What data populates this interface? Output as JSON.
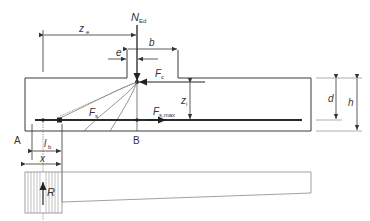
{
  "diagram": {
    "type": "strut-and-tie model of corbel / beam end with column load",
    "labels": {
      "load": "N",
      "load_sub": "Ed",
      "lever_ecc": "z",
      "lever_ecc_sub": "e",
      "eccentricity": "e",
      "column_width": "b",
      "compression_force": "F",
      "compression_sub": "c",
      "inner_lever": "z",
      "inner_lever_sub": "i",
      "tie_force": "F",
      "tie_sub": "s",
      "tie_max": "F",
      "tie_max_sub": "s,max",
      "effective_depth": "d",
      "height": "h",
      "point_a": "A",
      "point_b": "B",
      "anchorage": "l",
      "anchorage_sub": "b",
      "support_width": "x",
      "reaction": "R"
    },
    "colors": {
      "line": "#3a3a3a",
      "light_line": "#9a9a9a",
      "hatch": "#8a8a8a",
      "rebar": "#2a2a2a"
    }
  }
}
